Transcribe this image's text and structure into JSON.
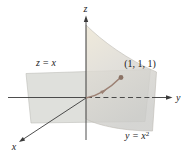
{
  "figure": {
    "plane_label": "z = x",
    "point_label": "(1, 1, 1)",
    "cylinder_label_base": "y = x",
    "cylinder_label_exponent": "2",
    "axis_x_label": "x",
    "axis_y_label": "y",
    "axis_z_label": "z"
  },
  "colors": {
    "background": "#ffffff",
    "plane_fill": "#dcddd8",
    "plane_edge": "#bdbeb8",
    "cylinder_tan": "#ece5d2",
    "cylinder_mid": "#dcd9d2",
    "cylinder_gray": "#cbcbc8",
    "cylinder_edge": "#bdbbb3",
    "axis": "#3a3a3a",
    "curve": "#9c8174",
    "point_dot": "#8b7365",
    "text": "#1a1a1a"
  }
}
